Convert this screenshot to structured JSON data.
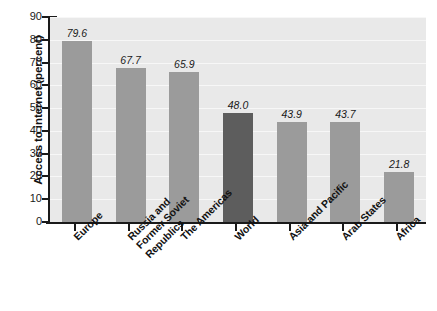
{
  "chart_data": {
    "type": "bar",
    "title": "",
    "xlabel": "",
    "ylabel": "Access to internet (percent)",
    "ylim": [
      0,
      90
    ],
    "ytick_step": 10,
    "yticks": [
      90,
      80,
      70,
      60,
      50,
      40,
      30,
      20,
      10,
      0
    ],
    "grid": true,
    "legend": "none",
    "categories": [
      "Europe",
      "Russia and\nFormer Soviet\nRepublics",
      "The Americas",
      "World",
      "Asia and Pacific",
      "Arab States",
      "Africa"
    ],
    "values": [
      79.6,
      67.7,
      65.9,
      48.0,
      43.9,
      43.7,
      21.8
    ],
    "value_labels": [
      "79.6",
      "67.7",
      "65.9",
      "48.0",
      "43.9",
      "43.7",
      "21.8"
    ],
    "bar_colors": [
      "#9b9b9b",
      "#9b9b9b",
      "#9b9b9b",
      "#5d5d5d",
      "#9b9b9b",
      "#9b9b9b",
      "#9b9b9b"
    ],
    "highlight_category": "World",
    "plot_background": "#e9e9e9",
    "gridline_color": "#f7f7f7",
    "axis_color": "#1a1a1a"
  }
}
